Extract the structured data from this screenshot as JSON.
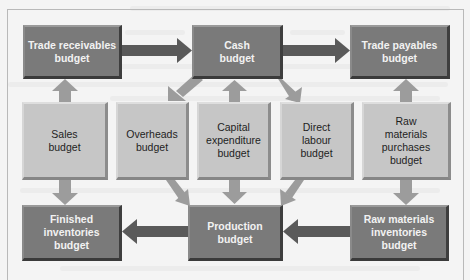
{
  "diagram": {
    "top_row": {
      "trade_receivables": "Trade receivables budget",
      "trade_receivables_lines": [
        "Trade receivables",
        "budget"
      ],
      "cash_lines": [
        "Cash",
        "budget"
      ],
      "trade_payables_lines": [
        "Trade payables",
        "budget"
      ]
    },
    "middle_row": {
      "sales_lines": [
        "Sales",
        "budget"
      ],
      "overheads_lines": [
        "Overheads",
        "budget"
      ],
      "capital_lines": [
        "Capital",
        "expenditure",
        "budget"
      ],
      "direct_labour_lines": [
        "Direct",
        "labour",
        "budget"
      ],
      "raw_purchases_lines": [
        "Raw",
        "materials",
        "purchases",
        "budget"
      ]
    },
    "bottom_row": {
      "finished_lines": [
        "Finished",
        "inventories",
        "budget"
      ],
      "production_lines": [
        "Production",
        "budget"
      ],
      "raw_inventories_lines": [
        "Raw materials",
        "inventories",
        "budget"
      ]
    },
    "connections": [
      {
        "from": "Trade receivables budget",
        "to": "Cash budget"
      },
      {
        "from": "Cash budget",
        "to": "Trade payables budget"
      },
      {
        "from": "Sales budget",
        "to": "Trade receivables budget"
      },
      {
        "from": "Sales budget",
        "to": "Finished inventories budget"
      },
      {
        "from": "Cash budget",
        "to": "Overheads budget"
      },
      {
        "from": "Capital expenditure budget",
        "to": "Cash budget"
      },
      {
        "from": "Cash budget",
        "to": "Direct labour budget"
      },
      {
        "from": "Raw materials purchases budget",
        "to": "Trade payables budget"
      },
      {
        "from": "Raw materials purchases budget",
        "to": "Raw materials inventories budget"
      },
      {
        "from": "Overheads budget",
        "to": "Production budget"
      },
      {
        "from": "Capital expenditure budget",
        "to": "Production budget"
      },
      {
        "from": "Direct labour budget",
        "to": "Production budget"
      },
      {
        "from": "Production budget",
        "to": "Finished inventories budget"
      },
      {
        "from": "Raw materials inventories budget",
        "to": "Production budget"
      }
    ],
    "colors": {
      "dark_box": "#7a7a7a",
      "light_box": "#c6c6c6",
      "dark_arrow": "#5a5a5a",
      "light_arrow": "#9c9c9c"
    }
  }
}
